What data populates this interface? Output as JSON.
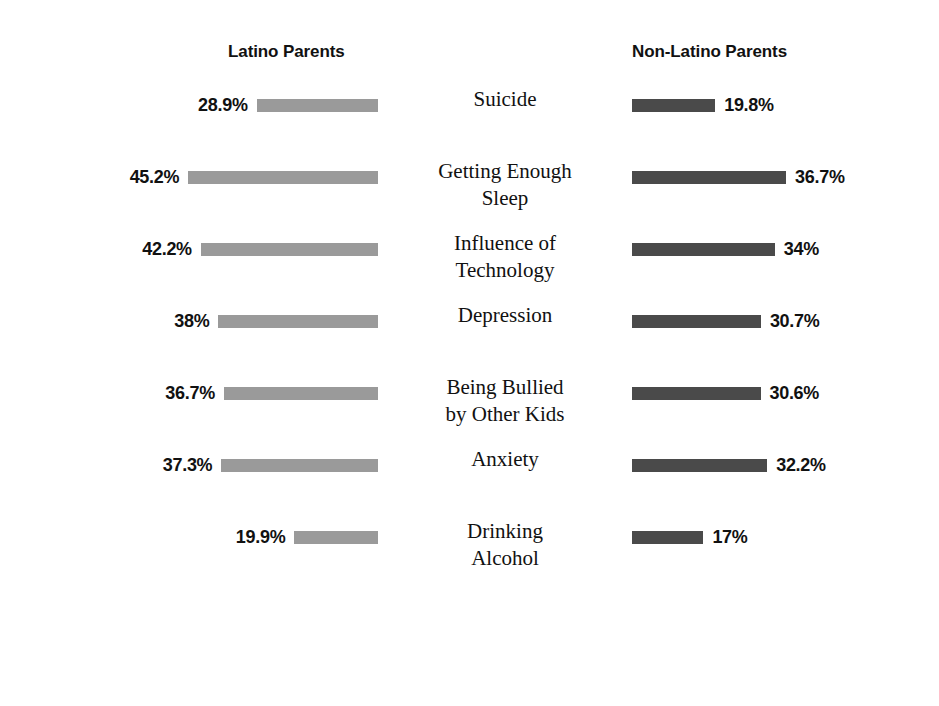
{
  "headers": {
    "left": "Latino Parents",
    "right": "Non-Latino Parents"
  },
  "colors": {
    "latino_bar": "#9a9a9a",
    "non_latino_bar": "#4a4a4a",
    "text": "#111111",
    "background": "#ffffff"
  },
  "rows": [
    {
      "category_lines": [
        "Suicide"
      ],
      "left_label": "28.9%",
      "right_label": "19.8%",
      "left_value": 28.9,
      "right_value": 19.8
    },
    {
      "category_lines": [
        "Getting Enough",
        "Sleep"
      ],
      "left_label": "45.2%",
      "right_label": "36.7%",
      "left_value": 45.2,
      "right_value": 36.7
    },
    {
      "category_lines": [
        "Influence of",
        "Technology"
      ],
      "left_label": "42.2%",
      "right_label": "34%",
      "left_value": 42.2,
      "right_value": 34
    },
    {
      "category_lines": [
        "Depression"
      ],
      "left_label": "38%",
      "right_label": "30.7%",
      "left_value": 38,
      "right_value": 30.7
    },
    {
      "category_lines": [
        "Being Bullied",
        "by Other Kids"
      ],
      "left_label": "36.7%",
      "right_label": "30.6%",
      "left_value": 36.7,
      "right_value": 30.6
    },
    {
      "category_lines": [
        "Anxiety"
      ],
      "left_label": "37.3%",
      "right_label": "32.2%",
      "left_value": 37.3,
      "right_value": 32.2
    },
    {
      "category_lines": [
        "Drinking",
        "Alcohol"
      ],
      "left_label": "19.9%",
      "right_label": "17%",
      "left_value": 19.9,
      "right_value": 17
    }
  ],
  "chart_data": {
    "type": "bar",
    "title": "",
    "subtitle": "",
    "orientation": "horizontal",
    "layout": "diverging-butterfly",
    "xlabel": "",
    "ylabel": "",
    "grid": false,
    "legend_position": "top-as-column-headers",
    "value_unit": "percent",
    "pixels_per_percent": 4.2,
    "categories": [
      "Suicide",
      "Getting Enough Sleep",
      "Influence of Technology",
      "Depression",
      "Being Bullied by Other Kids",
      "Anxiety",
      "Drinking Alcohol"
    ],
    "series": [
      {
        "name": "Latino Parents",
        "color": "#9a9a9a",
        "side": "left",
        "values": [
          28.9,
          45.2,
          42.2,
          38,
          36.7,
          37.3,
          19.9
        ],
        "labels": [
          "28.9%",
          "45.2%",
          "42.2%",
          "38%",
          "36.7%",
          "37.3%",
          "19.9%"
        ]
      },
      {
        "name": "Non-Latino Parents",
        "color": "#4a4a4a",
        "side": "right",
        "values": [
          19.8,
          36.7,
          34,
          30.7,
          30.6,
          32.2,
          17
        ],
        "labels": [
          "19.8%",
          "36.7%",
          "34%",
          "30.7%",
          "30.6%",
          "32.2%",
          "17%"
        ]
      }
    ],
    "xlim": [
      0,
      50
    ]
  }
}
